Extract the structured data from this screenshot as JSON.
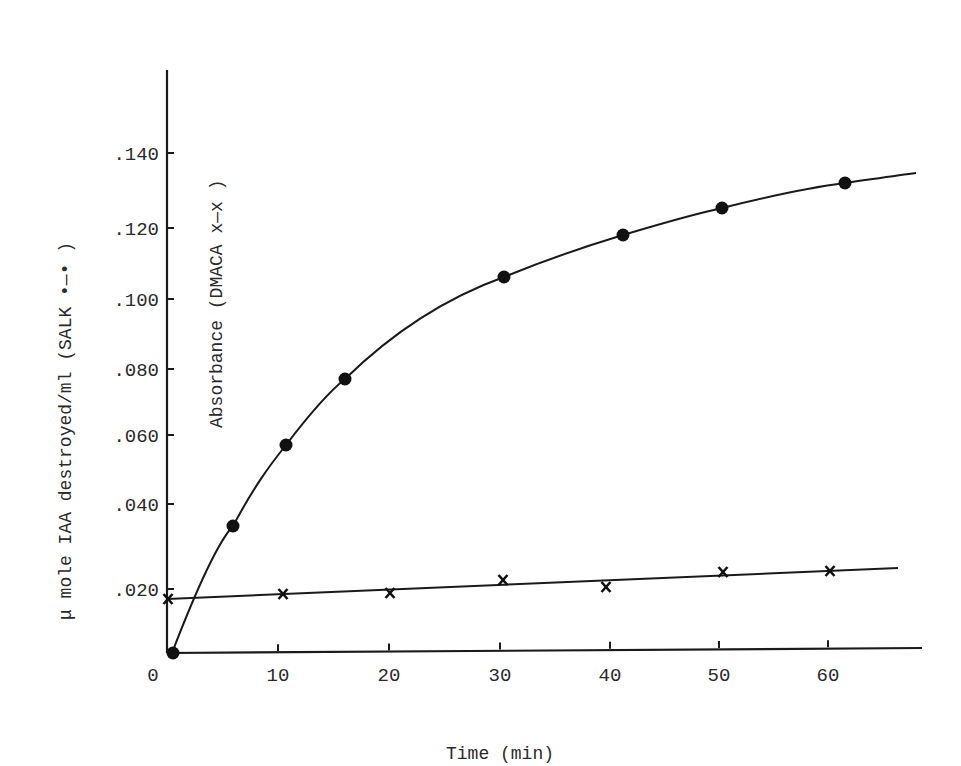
{
  "chart_data": {
    "type": "line",
    "title": "",
    "xlabel": "Time (min)",
    "ylabel": "μ mole IAA destroyed/ml (SALK •—•)",
    "ylabel2": "Absorbance (DMACA x—x)",
    "xlim": [
      0,
      67
    ],
    "ylim": [
      0,
      0.16
    ],
    "grid": false,
    "legend_position": "in y-axis labels",
    "x_ticks": [
      "0",
      "10",
      "20",
      "30",
      "40",
      "50",
      "60"
    ],
    "y_ticks": [
      ".020",
      ".040",
      ".060",
      ".080",
      ".100",
      ".120",
      ".140"
    ],
    "series": [
      {
        "name": "SALK",
        "marker": "filled-circle",
        "line": "smooth fitted curve",
        "x": [
          0.5,
          6,
          10.5,
          16,
          30,
          41,
          50,
          62
        ],
        "values": [
          0.0,
          0.035,
          0.057,
          0.077,
          0.106,
          0.117,
          0.124,
          0.132
        ]
      },
      {
        "name": "DMACA",
        "marker": "x",
        "line": "linear fit",
        "x": [
          0,
          10,
          20,
          30,
          40,
          50,
          60
        ],
        "values": [
          0.015,
          0.016,
          0.016,
          0.019,
          0.018,
          0.021,
          0.021
        ]
      }
    ]
  },
  "labels": {
    "origin": "0",
    "x_title": "Time (min)",
    "y_title_outer": "μ mole IAA destroyed/ml (SALK •—• )",
    "y_title_inner": "Absorbance (DMACA x—x )"
  },
  "colors": {
    "ink": "#1a1a1a",
    "background": "#ffffff"
  }
}
